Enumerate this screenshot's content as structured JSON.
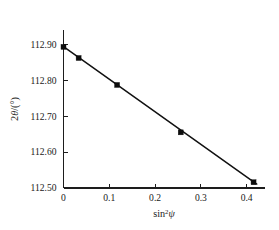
{
  "chart_data": {
    "type": "scatter",
    "title": "",
    "subtitle": "",
    "xlabel": "sin²ψ",
    "ylabel": "2θ/(°)",
    "xlabel_parts": {
      "base": "sin",
      "superscript": "2",
      "variable": "ψ"
    },
    "ylabel_parts": {
      "number": "2",
      "variable": "θ",
      "unit": "/(°)"
    },
    "xlim": [
      0.0,
      0.44
    ],
    "ylim": [
      112.5,
      112.94
    ],
    "xticks": [
      0,
      0.1,
      0.2,
      0.3,
      0.4
    ],
    "xticklabels": [
      "0",
      "0.1",
      "0.2",
      "0.3",
      "0.4"
    ],
    "yticks": [
      112.5,
      112.6,
      112.7,
      112.8,
      112.9
    ],
    "yticklabels": [
      "112.50",
      "112.60",
      "112.70",
      "112.80",
      "112.90"
    ],
    "grid": false,
    "legend": false,
    "legend_position": "none",
    "marker_style": "filled-square",
    "marker_color": "#0d0d0d",
    "line_color": "#111111",
    "axis_color": "#1d1d1d",
    "background_color": "#ffffff",
    "series": [
      {
        "name": "measured",
        "kind": "points",
        "x": [
          0.0,
          0.033,
          0.117,
          0.256,
          0.415
        ],
        "y": [
          112.893,
          112.862,
          112.787,
          112.655,
          112.516
        ]
      },
      {
        "name": "linear fit",
        "kind": "line",
        "x": [
          0.0,
          0.422
        ],
        "y": [
          112.894,
          112.511
        ]
      }
    ]
  },
  "figure": {
    "name": "sin-squared-psi-plot"
  }
}
